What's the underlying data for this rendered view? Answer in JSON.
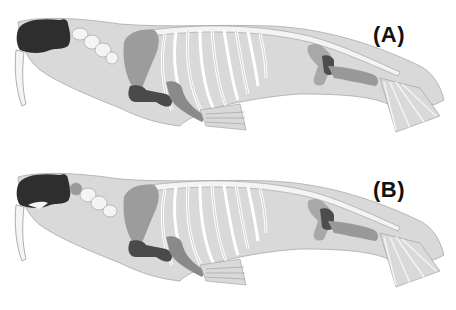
{
  "figure": {
    "colors": {
      "background": "#ffffff",
      "body_silhouette": "#d9d9d9",
      "body_outline": "#a8a8a8",
      "bone": "#f4f4f4",
      "bone_outline": "#9a9a9a",
      "skull": "#2e2e2e",
      "scapula": "#9c9c9c",
      "humerus": "#4a4a4a",
      "forearm": "#8a8a8a",
      "pelvis": "#a8a8a8",
      "femur": "#4d4d4d",
      "hind_leg": "#999999",
      "atlas_highlight": "#9a9a9a"
    },
    "panels": [
      {
        "id": "A",
        "label": "(A)",
        "atlas_highlighted": false
      },
      {
        "id": "B",
        "label": "(B)",
        "atlas_highlighted": true
      }
    ]
  }
}
